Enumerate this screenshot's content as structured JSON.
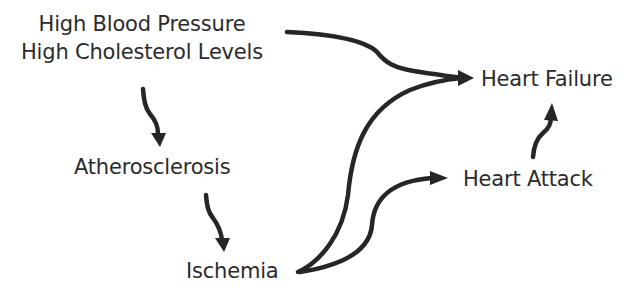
{
  "diagram": {
    "nodes": {
      "risk_factors": {
        "line1": "High Blood Pressure",
        "line2": "High Cholesterol Levels"
      },
      "atherosclerosis": "Atherosclerosis",
      "ischemia": "Ischemia",
      "heart_attack": "Heart Attack",
      "heart_failure": "Heart Failure"
    },
    "edges": [
      {
        "from": "High Blood Pressure / High Cholesterol Levels",
        "to": "Heart Failure"
      },
      {
        "from": "High Blood Pressure / High Cholesterol Levels",
        "to": "Atherosclerosis"
      },
      {
        "from": "Atherosclerosis",
        "to": "Ischemia"
      },
      {
        "from": "Ischemia",
        "to": "Heart Failure"
      },
      {
        "from": "Ischemia",
        "to": "Heart Attack"
      },
      {
        "from": "Heart Attack",
        "to": "Heart Failure"
      }
    ],
    "colors": {
      "text": "#2b2b2b",
      "arrow": "#262626",
      "background": "#ffffff"
    }
  }
}
